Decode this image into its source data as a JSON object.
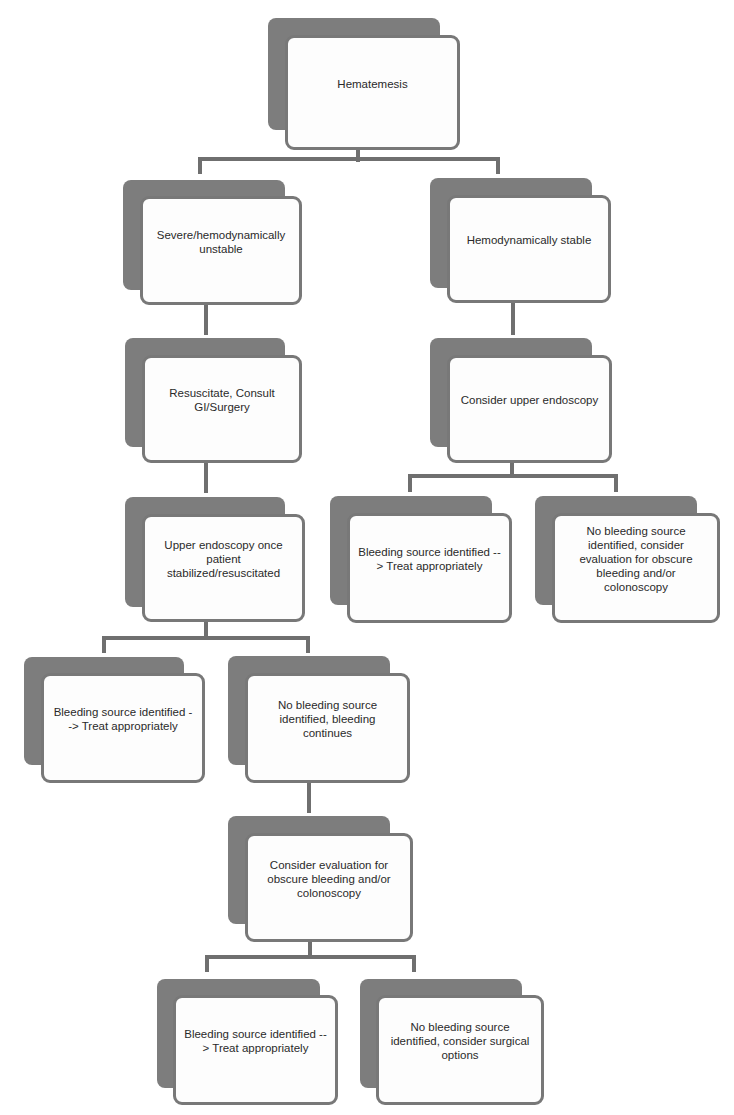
{
  "diagram": {
    "colors": {
      "back_card": "#7d7d7d",
      "front_card": "#fdfdfd",
      "border": "#787878",
      "connector": "#6f6f6f",
      "text": "#2a2a2a"
    },
    "nodes": {
      "root": {
        "label": "Hematemesis"
      },
      "severe": {
        "label": "Severe/hemodynamically unstable"
      },
      "stable": {
        "label": "Hemodynamically stable"
      },
      "resuscitate": {
        "label": "Resuscitate, Consult GI/Surgery"
      },
      "consider_endoscopy": {
        "label": "Consider upper endoscopy"
      },
      "endoscopy_once_stabilized": {
        "label": "Upper endoscopy once patient stabilized/resuscitated"
      },
      "stable_bleeding_identified": {
        "label": "Bleeding source identified --> Treat appropriately"
      },
      "stable_no_source": {
        "label": "No bleeding source identified, consider evaluation for obscure bleeding and/or colonoscopy"
      },
      "unstable_bleeding_identified": {
        "label": "Bleeding source identified --> Treat appropriately"
      },
      "unstable_no_source_continues": {
        "label": "No bleeding source identified, bleeding continues"
      },
      "evaluate_obscure": {
        "label": "Consider evaluation for obscure bleeding and/or colonoscopy"
      },
      "final_bleeding_identified": {
        "label": "Bleeding source identified --> Treat appropriately"
      },
      "final_no_source_surgical": {
        "label": "No bleeding source identified, consider surgical options"
      }
    },
    "edges": [
      [
        "root",
        "severe"
      ],
      [
        "root",
        "stable"
      ],
      [
        "severe",
        "resuscitate"
      ],
      [
        "resuscitate",
        "endoscopy_once_stabilized"
      ],
      [
        "stable",
        "consider_endoscopy"
      ],
      [
        "consider_endoscopy",
        "stable_bleeding_identified"
      ],
      [
        "consider_endoscopy",
        "stable_no_source"
      ],
      [
        "endoscopy_once_stabilized",
        "unstable_bleeding_identified"
      ],
      [
        "endoscopy_once_stabilized",
        "unstable_no_source_continues"
      ],
      [
        "unstable_no_source_continues",
        "evaluate_obscure"
      ],
      [
        "evaluate_obscure",
        "final_bleeding_identified"
      ],
      [
        "evaluate_obscure",
        "final_no_source_surgical"
      ]
    ]
  }
}
